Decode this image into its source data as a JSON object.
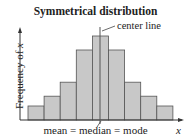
{
  "chart_data": {
    "type": "bar",
    "title": "Symmetrical distribution",
    "xlabel": "x",
    "ylabel": "Frequency of x",
    "categories": [
      "1",
      "2",
      "3",
      "4",
      "5",
      "6",
      "7",
      "8",
      "9"
    ],
    "values": [
      1,
      1.7,
      2.7,
      5,
      6,
      5,
      2.7,
      1.7,
      1
    ],
    "annotations": [
      "center line",
      "mean = median = mode"
    ],
    "grid": false,
    "bar_color": "#c8c8c8",
    "bar_edge_color": "#555555"
  },
  "labels": {
    "title": "Symmetrical distribution",
    "center_line": "center line",
    "ylabel_pre": "Frequency of ",
    "ylabel_var": "x",
    "bottom": "mean = median = mode",
    "xvar": "x"
  }
}
